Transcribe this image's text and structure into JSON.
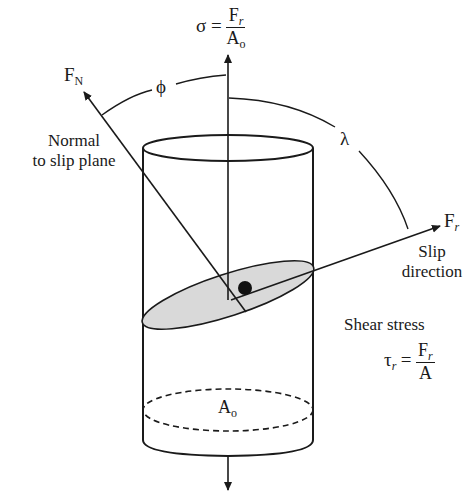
{
  "diagram": {
    "colors": {
      "stroke": "#1a1a1a",
      "slip_plane_fill": "#d9d9d9",
      "background": "#ffffff"
    },
    "labels": {
      "normal_stress": {
        "symbol": "σ",
        "equals": "=",
        "numerator": "F",
        "numerator_sub": "r",
        "denominator": "A",
        "denominator_sub": "o"
      },
      "normal_force": {
        "symbol": "F",
        "sub": "N"
      },
      "phi": "ϕ",
      "lambda": "λ",
      "normal_to_slip_plane": [
        "Normal",
        "to slip plane"
      ],
      "slip_force": {
        "symbol": "F",
        "sub": "r"
      },
      "slip_direction": [
        "Slip",
        "direction"
      ],
      "shear_stress_title": "Shear stress",
      "shear_stress": {
        "symbol": "τ",
        "sub": "r",
        "equals": "=",
        "numerator": "F",
        "numerator_sub": "r",
        "denominator": "A"
      },
      "cross_section_area": {
        "symbol": "A",
        "sub": "o"
      }
    },
    "elements": [
      "cylinder",
      "vertical-load-axis",
      "slip-plane-ellipse",
      "normal-vector-arrow",
      "slip-direction-arrow",
      "phi-angle-arc",
      "lambda-angle-arc",
      "cross-section-dashed-ellipse",
      "center-dot"
    ]
  }
}
